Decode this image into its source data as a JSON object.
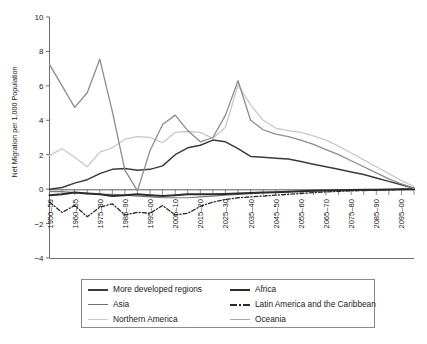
{
  "chart_data": {
    "type": "line",
    "title": "",
    "xlabel": "",
    "ylabel": "Net Migration per 1,000 Population",
    "ylim": [
      -4,
      10
    ],
    "yticks": [
      -4,
      -2,
      0,
      2,
      4,
      6,
      8,
      10
    ],
    "ytick_labels": [
      "−4",
      "−2",
      "0",
      "2",
      "4",
      "6",
      "8",
      "10"
    ],
    "grid": false,
    "legend_position": "below-plot",
    "x": [
      "1950–55",
      "1955–60",
      "1960–65",
      "1965–70",
      "1970–75",
      "1975–80",
      "1980–85",
      "1985–90",
      "1990–95",
      "1995–00",
      "2000–05",
      "2005–10",
      "2010–15",
      "2015–20",
      "2020–25",
      "2025–30",
      "2030–35",
      "2035–40",
      "2040–45",
      "2045–50",
      "2050–55",
      "2055–60",
      "2060–65",
      "2065–70",
      "2070–75",
      "2075–80",
      "2080–85",
      "2085–90",
      "2090–95",
      "2095–00"
    ],
    "xtick_labels_shown": [
      "1950–59",
      "1960–65",
      "1975–80",
      "1985–90",
      "1995–00",
      "2005–10",
      "2015–20",
      "2025–30",
      "2035–40",
      "2045–50",
      "2055–60",
      "2065–70",
      "2075–80",
      "2085–90",
      "2095–00"
    ],
    "series": [
      {
        "name": "More developed regions",
        "color": "#3b3b3b",
        "width": 1.5,
        "dash": "solid",
        "values": [
          0.0,
          0.1,
          0.35,
          0.55,
          0.9,
          1.15,
          1.2,
          1.1,
          1.15,
          1.35,
          2.0,
          2.4,
          2.55,
          2.85,
          2.75,
          2.35,
          1.9,
          1.85,
          1.8,
          1.75,
          1.6,
          1.45,
          1.3,
          1.15,
          1.0,
          0.85,
          0.65,
          0.45,
          0.25,
          0.05
        ]
      },
      {
        "name": "Asia",
        "color": "#7d7d7d",
        "width": 1.2,
        "dash": "solid",
        "values": [
          -0.15,
          -0.15,
          -0.2,
          -0.25,
          -0.3,
          -0.3,
          -0.35,
          -0.4,
          -0.45,
          -0.5,
          -0.5,
          -0.5,
          -0.45,
          -0.4,
          -0.35,
          -0.3,
          -0.25,
          -0.2,
          -0.18,
          -0.15,
          -0.12,
          -0.1,
          -0.08,
          -0.06,
          -0.05,
          -0.04,
          -0.03,
          -0.02,
          -0.01,
          0.0
        ]
      },
      {
        "name": "Northern America",
        "color": "#c9c9c9",
        "width": 1.3,
        "dash": "solid",
        "values": [
          1.95,
          2.35,
          1.85,
          1.3,
          2.15,
          2.4,
          2.9,
          3.05,
          3.0,
          2.7,
          3.3,
          3.35,
          3.3,
          2.95,
          3.6,
          6.05,
          4.9,
          4.0,
          3.55,
          3.4,
          3.3,
          3.1,
          2.85,
          2.5,
          2.1,
          1.7,
          1.3,
          0.9,
          0.5,
          0.15
        ]
      },
      {
        "name": "Africa",
        "color": "#2b2b2b",
        "width": 2.0,
        "dash": "solid",
        "values": [
          -0.35,
          -0.3,
          -0.2,
          -0.25,
          -0.3,
          -0.4,
          -0.35,
          -0.3,
          -0.35,
          -0.4,
          -0.35,
          -0.3,
          -0.3,
          -0.3,
          -0.28,
          -0.25,
          -0.22,
          -0.2,
          -0.18,
          -0.15,
          -0.12,
          -0.1,
          -0.08,
          -0.06,
          -0.05,
          -0.04,
          -0.03,
          -0.02,
          -0.01,
          0.0
        ]
      },
      {
        "name": "Latin America and the Caribbean",
        "color": "#2b2b2b",
        "width": 1.3,
        "dash": "dashdot",
        "values": [
          -0.75,
          -1.35,
          -0.95,
          -1.6,
          -1.05,
          -0.85,
          -1.5,
          -1.35,
          -1.4,
          -0.95,
          -1.5,
          -1.4,
          -1.0,
          -0.75,
          -0.6,
          -0.5,
          -0.45,
          -0.4,
          -0.35,
          -0.3,
          -0.25,
          -0.2,
          -0.16,
          -0.13,
          -0.1,
          -0.08,
          -0.06,
          -0.04,
          -0.02,
          0.0
        ]
      },
      {
        "name": "Oceania",
        "color": "#8c8c8c",
        "width": 1.3,
        "dash": "solid",
        "values": [
          7.25,
          6.0,
          4.75,
          5.6,
          7.55,
          4.5,
          1.1,
          -0.1,
          2.25,
          3.75,
          4.3,
          3.4,
          2.75,
          3.0,
          4.3,
          6.3,
          4.0,
          3.45,
          3.2,
          3.05,
          2.85,
          2.6,
          2.3,
          2.0,
          1.65,
          1.3,
          0.95,
          0.6,
          0.3,
          0.05
        ]
      }
    ]
  },
  "legend": {
    "entries": [
      {
        "label": "More developed regions",
        "swatch": "line-solid-dark",
        "color": "#3b3b3b",
        "thickness": 2,
        "dash": "solid"
      },
      {
        "label": "Africa",
        "swatch": "line-solid-black-thick",
        "color": "#2b2b2b",
        "thickness": 2.4,
        "dash": "solid"
      },
      {
        "label": "Asia",
        "swatch": "line-solid-gray",
        "color": "#6f6f6f",
        "thickness": 1.8,
        "dash": "solid"
      },
      {
        "label": "Latin America and the Caribbean",
        "swatch": "line-dashdot-dark",
        "color": "#2b2b2b",
        "thickness": 2,
        "dash": "dashdot"
      },
      {
        "label": "Northern America",
        "swatch": "line-solid-lightgray",
        "color": "#c9c9c9",
        "thickness": 1.6,
        "dash": "solid"
      },
      {
        "label": "Oceania",
        "swatch": "line-solid-midgray",
        "color": "#a8a8a8",
        "thickness": 1.6,
        "dash": "solid"
      }
    ]
  },
  "caption": {
    "text": ""
  }
}
